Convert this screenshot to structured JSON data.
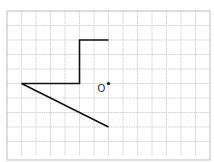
{
  "diagram": {
    "type": "grid-figure",
    "grid": {
      "cols": 14,
      "rows": 10,
      "cell_px": 14.5,
      "origin_px": [
        7,
        11
      ],
      "line_color": "#cccccc"
    },
    "shape": {
      "description": "Open polyline on grid",
      "points_grid": [
        [
          7,
          2
        ],
        [
          5,
          2
        ],
        [
          5,
          5
        ],
        [
          1,
          5
        ],
        [
          7,
          8
        ]
      ],
      "stroke": "#111111"
    },
    "point": {
      "label": "O",
      "grid": [
        7,
        5
      ]
    }
  }
}
